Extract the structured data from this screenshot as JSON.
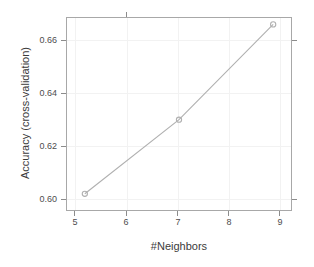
{
  "chart_data": {
    "type": "line",
    "title": "",
    "subtitle": "",
    "xlabel": "#Neighbors",
    "ylabel": "Accuracy (cross-validation)",
    "x": [
      5,
      7,
      9
    ],
    "values": [
      0.599,
      0.627,
      0.663
    ],
    "series": [
      {
        "name": "Accuracy (cross-validation)",
        "x": [
          5,
          7,
          9
        ],
        "values": [
          0.599,
          0.627,
          0.663
        ]
      }
    ],
    "xlim": [
      4.6,
      9.4
    ],
    "ylim": [
      0.5925,
      0.6658
    ],
    "xticks": [
      5,
      6,
      7,
      8,
      9
    ],
    "xtick_labels": [
      "5",
      "6",
      "7",
      "8",
      "9"
    ],
    "yticks": [
      0.6,
      0.62,
      0.64,
      0.66
    ],
    "ytick_labels": [
      "0.60",
      "0.62",
      "0.64",
      "0.66"
    ],
    "grid": true,
    "legend": null,
    "legend_position": "none",
    "annotations": [],
    "marker": "open-circle",
    "line_color": "#b0b0b0",
    "marker_color": "#b0b0b0",
    "frame_color": "#a8a8a8",
    "grid_color": "#f2f2f2",
    "text_color": "#4d4d4d",
    "background": "#ffffff"
  },
  "axes": {
    "x": {
      "title": "#Neighbors",
      "ticks": [
        {
          "label": "5",
          "value": 5
        },
        {
          "label": "6",
          "value": 6
        },
        {
          "label": "7",
          "value": 7
        },
        {
          "label": "8",
          "value": 8
        },
        {
          "label": "9",
          "value": 9
        }
      ]
    },
    "y": {
      "title": "Accuracy (cross-validation)",
      "ticks": [
        {
          "label": "0.60",
          "value": 0.6
        },
        {
          "label": "0.62",
          "value": 0.62
        },
        {
          "label": "0.64",
          "value": 0.64
        },
        {
          "label": "0.66",
          "value": 0.66
        }
      ]
    }
  }
}
